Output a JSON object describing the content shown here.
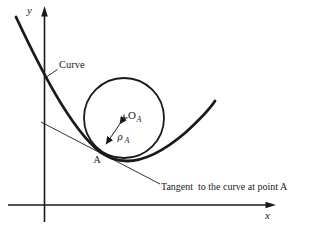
{
  "figure": {
    "axis_labels": {
      "y": "y",
      "x": "x"
    },
    "labels": {
      "curve": "Curve",
      "center_letter": "O",
      "center_subscript": "A",
      "radius_letter": "ρ",
      "radius_subscript": "A",
      "point_a": "A",
      "tangent": "Tangent  to the curve at point A"
    },
    "colors": {
      "ink": "#1a1a1a",
      "background": "#ffffff"
    }
  }
}
